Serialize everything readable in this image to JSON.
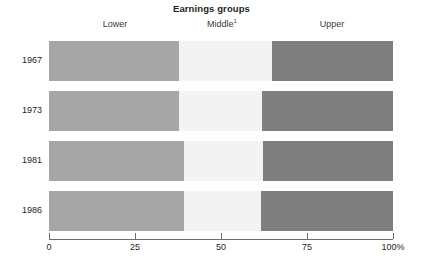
{
  "chart_data": {
    "type": "bar",
    "title": "Earnings groups",
    "xlabel": "",
    "ylabel": "",
    "orientation": "horizontal",
    "stacked": true,
    "grid": false,
    "legend_position": "top",
    "xlim": [
      0,
      100
    ],
    "categories": [
      "1967",
      "1973",
      "1981",
      "1986"
    ],
    "series": [
      {
        "name": "Lower",
        "values": [
          37.8,
          37.8,
          39.2,
          39.2
        ],
        "color": "#a6a6a6"
      },
      {
        "name": "Middle",
        "values": [
          27.0,
          24.1,
          23.0,
          22.4
        ],
        "color": "#f3f3f3"
      },
      {
        "name": "Upper",
        "values": [
          35.2,
          38.1,
          37.8,
          38.4
        ],
        "color": "#7f7f7f"
      }
    ],
    "boundaries": [
      {
        "category": "1967",
        "lower_end": 37.8,
        "middle_end": 64.8
      },
      {
        "category": "1973",
        "lower_end": 37.8,
        "middle_end": 61.9
      },
      {
        "category": "1981",
        "lower_end": 39.2,
        "middle_end": 62.2
      },
      {
        "category": "1986",
        "lower_end": 39.2,
        "middle_end": 61.6
      }
    ],
    "xticks": [
      0,
      25,
      50,
      75,
      100
    ],
    "xticklabels": [
      "0",
      "25",
      "50",
      "75",
      "100%"
    ],
    "annotations": [
      "Middle group label carries footnote marker 1"
    ]
  },
  "header": {
    "title": "Earnings groups"
  },
  "groups": [
    {
      "label": "Lower",
      "footnote": "",
      "center_pct": 19.2
    },
    {
      "label": "Middle",
      "footnote": "1",
      "center_pct": 50.3
    },
    {
      "label": "Upper",
      "footnote": "",
      "center_pct": 82.3
    }
  ],
  "rows": [
    {
      "year": "1967",
      "segments": [
        {
          "name": "Lower",
          "width_pct": 37.8
        },
        {
          "name": "Middle",
          "width_pct": 27.0
        },
        {
          "name": "Upper",
          "width_pct": 35.2
        }
      ]
    },
    {
      "year": "1973",
      "segments": [
        {
          "name": "Lower",
          "width_pct": 37.8
        },
        {
          "name": "Middle",
          "width_pct": 24.1
        },
        {
          "name": "Upper",
          "width_pct": 38.1
        }
      ]
    },
    {
      "year": "1981",
      "segments": [
        {
          "name": "Lower",
          "width_pct": 39.2
        },
        {
          "name": "Middle",
          "width_pct": 23.0
        },
        {
          "name": "Upper",
          "width_pct": 37.8
        }
      ]
    },
    {
      "year": "1986",
      "segments": [
        {
          "name": "Lower",
          "width_pct": 39.2
        },
        {
          "name": "Middle",
          "width_pct": 22.4
        },
        {
          "name": "Upper",
          "width_pct": 38.4
        }
      ]
    }
  ],
  "axis": {
    "ticks": [
      {
        "label": "0",
        "value": 0
      },
      {
        "label": "25",
        "value": 25
      },
      {
        "label": "50",
        "value": 50
      },
      {
        "label": "75",
        "value": 75
      },
      {
        "label": "100%",
        "value": 100
      }
    ]
  },
  "colors": {
    "lower": "#a6a6a6",
    "middle": "#f3f3f3",
    "upper": "#7f7f7f",
    "axis": "#6d6d6d",
    "text": "#231f20"
  }
}
